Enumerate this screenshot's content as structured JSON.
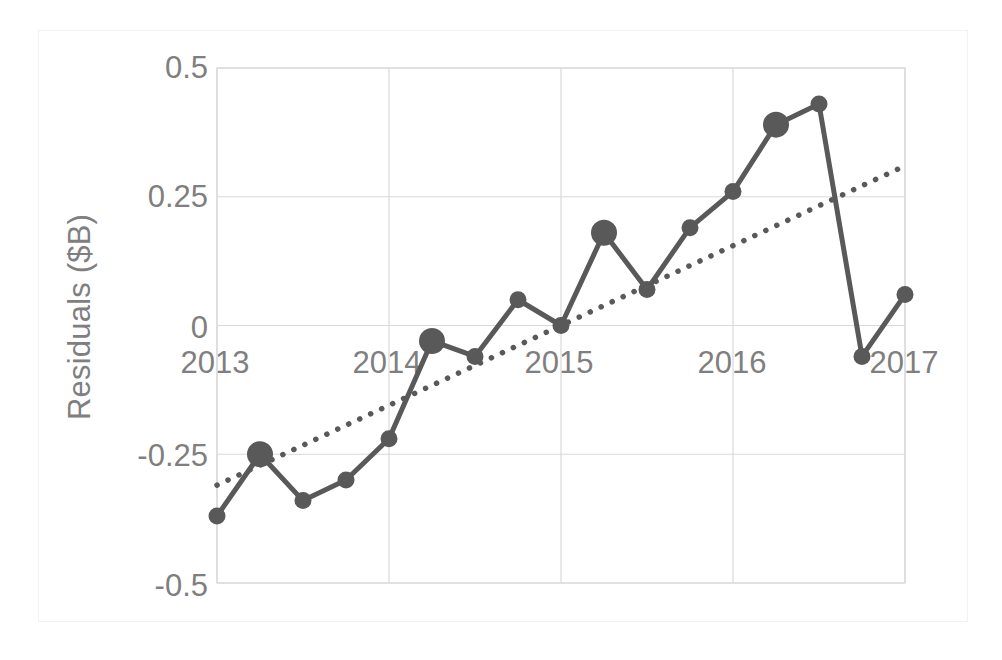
{
  "chart_data": {
    "type": "line",
    "title": "",
    "xlabel": "",
    "ylabel": "Residuals ($B)",
    "ylim": [
      -0.5,
      0.5
    ],
    "xlim": [
      2013.0,
      2017.0
    ],
    "grid": true,
    "legend": null,
    "y_ticks": [
      "0.5",
      "0.25",
      "0",
      "-0.25",
      "-0.5"
    ],
    "y_tick_values": [
      0.5,
      0.25,
      0,
      -0.25,
      -0.5
    ],
    "x_ticks": [
      "2013",
      "2014",
      "2015",
      "2016",
      "2017"
    ],
    "x_tick_values": [
      2013,
      2014,
      2015,
      2016,
      2017
    ],
    "series": [
      {
        "name": "Residuals",
        "style": "solid-line-with-markers",
        "color": "#595959",
        "x": [
          2013.0,
          2013.25,
          2013.5,
          2013.75,
          2014.0,
          2014.25,
          2014.5,
          2014.75,
          2015.0,
          2015.25,
          2015.5,
          2015.75,
          2016.0,
          2016.25,
          2016.5,
          2016.75,
          2017.0
        ],
        "values": [
          -0.37,
          -0.25,
          -0.34,
          -0.3,
          -0.22,
          -0.03,
          -0.06,
          0.05,
          0.0,
          0.18,
          0.07,
          0.19,
          0.26,
          0.39,
          0.43,
          -0.06,
          0.06
        ],
        "marker_large_index": [
          1,
          5,
          9,
          13
        ]
      },
      {
        "name": "Trendline",
        "style": "dotted-line",
        "color": "#595959",
        "x": [
          2013.0,
          2017.0
        ],
        "values": [
          -0.31,
          0.31
        ]
      }
    ]
  },
  "chart": {
    "y_axis_title": "Residuals ($B)",
    "axis_color": "#7f7f7f",
    "grid_color": "#d9d9d9",
    "series_color": "#595959",
    "background": "#ffffff"
  }
}
